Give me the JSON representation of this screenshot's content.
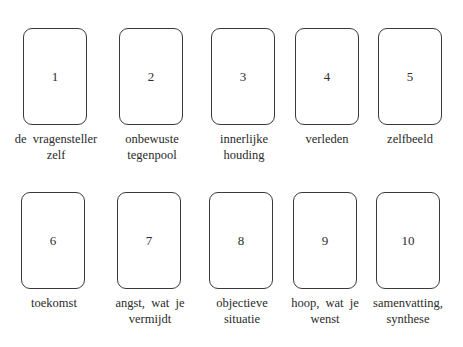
{
  "diagram": {
    "type": "tarot-spread-layout",
    "rows": [
      {
        "cards": [
          {
            "number": "1",
            "label_line1": "de  vragensteller",
            "label_line2": "zelf"
          },
          {
            "number": "2",
            "label_line1": "onbewuste",
            "label_line2": "tegenpool"
          },
          {
            "number": "3",
            "label_line1": "innerlijke",
            "label_line2": "houding"
          },
          {
            "number": "4",
            "label_line1": "verleden",
            "label_line2": ""
          },
          {
            "number": "5",
            "label_line1": "zelfbeeld",
            "label_line2": ""
          }
        ]
      },
      {
        "cards": [
          {
            "number": "6",
            "label_line1": "toekomst",
            "label_line2": ""
          },
          {
            "number": "7",
            "label_line1": "angst,  wat  je",
            "label_line2": "vermijdt"
          },
          {
            "number": "8",
            "label_line1": "objectieve",
            "label_line2": "situatie"
          },
          {
            "number": "9",
            "label_line1": "hoop,  wat  je",
            "label_line2": "wenst"
          },
          {
            "number": "10",
            "label_line1": "samenvatting,",
            "label_line2": "synthese"
          }
        ]
      }
    ],
    "colors": {
      "background": "#ffffff",
      "card_border": "#3a3a3a",
      "text": "#2a2a2a"
    }
  }
}
